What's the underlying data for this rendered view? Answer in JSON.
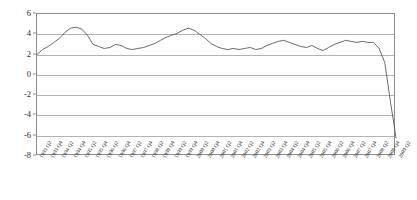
{
  "chart_data": {
    "type": "line",
    "title": "",
    "subtitle": "",
    "xlabel": "",
    "ylabel": "",
    "ylim": [
      -8,
      6
    ],
    "ytick_values": [
      6,
      4,
      2,
      0,
      -2,
      -4,
      -6,
      -8
    ],
    "ytick_labels": [
      "6",
      "4",
      "2",
      "0",
      "-2",
      "-4",
      "-6",
      "-8"
    ],
    "grid": true,
    "legend": false,
    "legend_position": "none",
    "line_color": "#595959",
    "gridline_color": "#b3b3b3",
    "frame_color": "#8e8e8e",
    "categories": [
      "1993 Q2",
      "1993 Q3",
      "1993 Q4",
      "1994 Q1",
      "1994 Q2",
      "1994 Q3",
      "1994 Q4",
      "1995 Q1",
      "1995 Q2",
      "1995 Q3",
      "1995 Q4",
      "1996 Q1",
      "1996 Q2",
      "1996 Q3",
      "1996 Q4",
      "1997 Q1",
      "1997 Q2",
      "1997 Q3",
      "1997 Q4",
      "1998 Q1",
      "1998 Q2",
      "1998 Q3",
      "1998 Q4",
      "1999 Q1",
      "1999 Q2",
      "1999 Q3",
      "1999 Q4",
      "2000 Q1",
      "2000 Q2",
      "2000 Q3",
      "2000 Q4",
      "2001 Q1",
      "2001 Q2",
      "2001 Q3",
      "2001 Q4",
      "2002 Q1",
      "2002 Q2",
      "2002 Q3",
      "2002 Q4",
      "2003 Q1",
      "2003 Q2",
      "2003 Q3",
      "2003 Q4",
      "2004 Q1",
      "2004 Q2",
      "2004 Q3",
      "2004 Q4",
      "2005 Q1",
      "2005 Q2",
      "2005 Q3",
      "2005 Q4",
      "2006 Q1",
      "2006 Q2",
      "2006 Q3",
      "2006 Q4",
      "2007 Q1",
      "2007 Q2",
      "2007 Q3",
      "2007 Q4",
      "2008 Q1",
      "2008 Q2",
      "2008 Q3",
      "2008 Q4",
      "2009 Q1",
      "2009 Q2"
    ],
    "xtick_labels": [
      "1993 Q2",
      "1993 Q4",
      "1994 Q2",
      "1994 Q4",
      "1995 Q2",
      "1995 Q4",
      "1996 Q2",
      "1996 Q4",
      "1997 Q2",
      "1997 Q4",
      "1998 Q2",
      "1998 Q4",
      "1999 Q2",
      "1999 Q4",
      "2000 Q2",
      "2000 Q4",
      "2001 Q2",
      "2001 Q4",
      "2002 Q2",
      "2002 Q4",
      "2003 Q2",
      "2003 Q4",
      "2004 Q2",
      "2004 Q4",
      "2005 Q2",
      "2005 Q4",
      "2006 Q2",
      "2006 Q4",
      "2007 Q2",
      "2007 Q4",
      "2008 Q2",
      "2008 Q4",
      "2009 Q2"
    ],
    "values": [
      2.0,
      2.5,
      2.8,
      3.2,
      3.6,
      4.2,
      4.6,
      4.7,
      4.5,
      3.9,
      3.0,
      2.8,
      2.6,
      2.7,
      3.0,
      2.9,
      2.6,
      2.5,
      2.6,
      2.7,
      2.9,
      3.1,
      3.4,
      3.7,
      3.9,
      4.1,
      4.4,
      4.6,
      4.4,
      4.0,
      3.6,
      3.1,
      2.8,
      2.6,
      2.5,
      2.6,
      2.5,
      2.6,
      2.7,
      2.5,
      2.6,
      2.9,
      3.1,
      3.3,
      3.4,
      3.2,
      3.0,
      2.8,
      2.7,
      2.9,
      2.6,
      2.4,
      2.7,
      3.0,
      3.2,
      3.4,
      3.3,
      3.2,
      3.3,
      3.2,
      3.2,
      2.6,
      1.2,
      -2.6,
      -6.2
    ],
    "annotations": []
  }
}
